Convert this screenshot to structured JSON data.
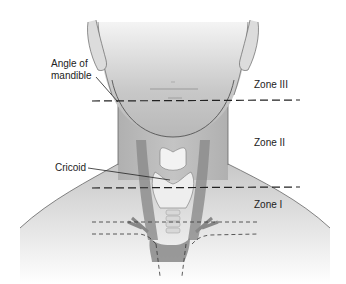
{
  "diagram": {
    "type": "anatomical-zones",
    "labels": {
      "angle_of_mandible_line1": "Angle of",
      "angle_of_mandible_line2": "mandible",
      "cricoid": "Cricoid",
      "zone3": "Zone III",
      "zone2": "Zone II",
      "zone1": "Zone I"
    },
    "zones": [
      {
        "name": "Zone III",
        "boundary": "above angle of mandible"
      },
      {
        "name": "Zone II",
        "boundary": "between angle of mandible and cricoid"
      },
      {
        "name": "Zone I",
        "boundary": "below cricoid"
      }
    ],
    "colors": {
      "skin_dark": "#a8a8a8",
      "skin_light": "#e8e8e8",
      "outline": "#555555",
      "dashed_line": "#222222",
      "cartilage": "#f2f2f2",
      "vessel": "#7a7a7a"
    }
  }
}
